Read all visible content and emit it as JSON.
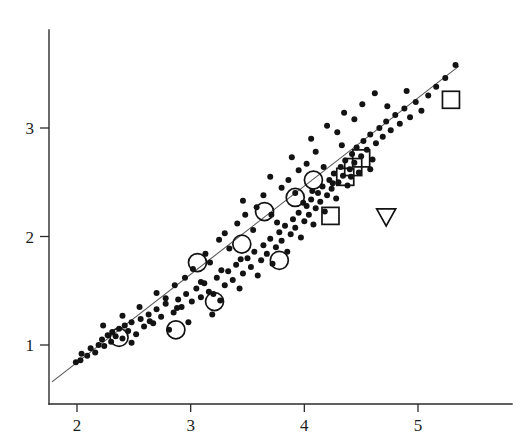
{
  "figure": {
    "width": 522,
    "height": 444,
    "background": "#ffffff",
    "ink_color": "#131313",
    "line_color": "#59595c"
  },
  "axes": {
    "x_tick_labels": [
      "2",
      "3",
      "4",
      "5"
    ],
    "y_tick_labels": [
      "1",
      "2",
      "3"
    ],
    "x_label": "",
    "y_label": "",
    "title": ""
  },
  "chart_data": {
    "type": "scatter",
    "title": "",
    "xlabel": "",
    "ylabel": "",
    "xlim": [
      1.78,
      5.58
    ],
    "ylim": [
      0.55,
      3.75
    ],
    "xticks": [
      2,
      3,
      4,
      5
    ],
    "yticks": [
      1,
      2,
      3
    ],
    "grid": false,
    "legend": "none",
    "reference_line": {
      "name": "identity-fit-line",
      "x_start": 1.78,
      "y_start": 0.66,
      "x_end": 5.36,
      "y_end": 3.57
    },
    "series": [
      {
        "name": "observations",
        "marker": "filled-circle",
        "marker_radius": 3.0,
        "points": [
          [
            1.99,
            0.84
          ],
          [
            2.03,
            0.86
          ],
          [
            2.04,
            0.92
          ],
          [
            2.09,
            0.9
          ],
          [
            2.12,
            0.97
          ],
          [
            2.16,
            0.93
          ],
          [
            2.19,
            1.0
          ],
          [
            2.22,
            1.05
          ],
          [
            2.24,
            0.99
          ],
          [
            2.27,
            1.09
          ],
          [
            2.3,
            1.03
          ],
          [
            2.31,
            1.12
          ],
          [
            2.34,
            1.08
          ],
          [
            2.37,
            1.15
          ],
          [
            2.4,
            1.06
          ],
          [
            2.42,
            1.18
          ],
          [
            2.45,
            1.13
          ],
          [
            2.48,
            1.21
          ],
          [
            2.52,
            1.1
          ],
          [
            2.56,
            1.24
          ],
          [
            2.59,
            1.17
          ],
          [
            2.63,
            1.28
          ],
          [
            2.67,
            1.2
          ],
          [
            2.7,
            1.33
          ],
          [
            2.74,
            1.26
          ],
          [
            2.78,
            1.38
          ],
          [
            2.81,
            1.14
          ],
          [
            2.85,
            1.3
          ],
          [
            2.89,
            1.42
          ],
          [
            2.92,
            1.35
          ],
          [
            2.96,
            1.47
          ],
          [
            2.98,
            1.21
          ],
          [
            3.01,
            1.4
          ],
          [
            3.05,
            1.52
          ],
          [
            3.09,
            1.44
          ],
          [
            3.12,
            1.57
          ],
          [
            3.16,
            1.49
          ],
          [
            3.19,
            1.28
          ],
          [
            3.23,
            1.62
          ],
          [
            3.26,
            1.41
          ],
          [
            3.3,
            1.55
          ],
          [
            3.33,
            1.68
          ],
          [
            3.37,
            1.6
          ],
          [
            3.4,
            1.74
          ],
          [
            3.43,
            1.52
          ],
          [
            3.46,
            1.66
          ],
          [
            3.5,
            1.8
          ],
          [
            3.53,
            1.72
          ],
          [
            3.56,
            1.86
          ],
          [
            3.59,
            1.64
          ],
          [
            3.62,
            1.78
          ],
          [
            3.64,
            1.92
          ],
          [
            3.67,
            1.84
          ],
          [
            3.7,
            1.98
          ],
          [
            3.72,
            1.75
          ],
          [
            3.75,
            1.9
          ],
          [
            3.78,
            2.04
          ],
          [
            3.8,
            1.96
          ],
          [
            3.83,
            2.1
          ],
          [
            3.85,
            1.86
          ],
          [
            3.88,
            2.02
          ],
          [
            3.9,
            2.16
          ],
          [
            3.92,
            2.08
          ],
          [
            3.95,
            2.22
          ],
          [
            3.97,
            1.99
          ],
          [
            4.0,
            2.14
          ],
          [
            4.02,
            2.28
          ],
          [
            4.04,
            2.2
          ],
          [
            4.06,
            2.34
          ],
          [
            4.08,
            2.11
          ],
          [
            4.1,
            2.26
          ],
          [
            4.12,
            2.4
          ],
          [
            4.14,
            2.32
          ],
          [
            4.16,
            2.46
          ],
          [
            4.18,
            2.23
          ],
          [
            4.2,
            2.38
          ],
          [
            4.22,
            2.52
          ],
          [
            4.24,
            2.44
          ],
          [
            4.26,
            2.58
          ],
          [
            4.28,
            2.35
          ],
          [
            4.3,
            2.5
          ],
          [
            4.32,
            2.64
          ],
          [
            4.34,
            2.56
          ],
          [
            4.36,
            2.7
          ],
          [
            4.38,
            2.47
          ],
          [
            4.4,
            2.62
          ],
          [
            4.42,
            2.76
          ],
          [
            4.44,
            2.68
          ],
          [
            4.46,
            2.82
          ],
          [
            4.48,
            2.59
          ],
          [
            4.5,
            2.74
          ],
          [
            4.52,
            2.88
          ],
          [
            4.55,
            2.8
          ],
          [
            4.58,
            2.94
          ],
          [
            4.6,
            2.71
          ],
          [
            4.63,
            2.86
          ],
          [
            4.66,
            3.0
          ],
          [
            4.69,
            2.92
          ],
          [
            4.72,
            3.06
          ],
          [
            4.76,
            2.98
          ],
          [
            4.8,
            3.12
          ],
          [
            4.84,
            3.04
          ],
          [
            4.88,
            3.18
          ],
          [
            4.93,
            3.1
          ],
          [
            4.98,
            3.24
          ],
          [
            5.03,
            3.16
          ],
          [
            5.09,
            3.3
          ],
          [
            5.16,
            3.38
          ],
          [
            5.24,
            3.46
          ],
          [
            5.33,
            3.58
          ],
          [
            3.7,
            2.55
          ],
          [
            3.46,
            2.33
          ],
          [
            3.89,
            2.73
          ],
          [
            4.06,
            2.9
          ],
          [
            3.3,
            2.03
          ],
          [
            3.13,
            1.84
          ],
          [
            4.2,
            3.02
          ],
          [
            4.35,
            3.14
          ],
          [
            3.02,
            1.7
          ],
          [
            2.86,
            1.55
          ],
          [
            4.51,
            3.22
          ],
          [
            2.7,
            1.48
          ],
          [
            3.58,
            2.27
          ],
          [
            3.41,
            2.12
          ],
          [
            3.25,
            1.97
          ],
          [
            3.95,
            2.61
          ],
          [
            4.1,
            2.78
          ],
          [
            2.55,
            1.35
          ],
          [
            2.4,
            1.27
          ],
          [
            3.8,
            2.45
          ],
          [
            4.29,
            2.96
          ],
          [
            3.64,
            2.38
          ],
          [
            3.48,
            2.2
          ],
          [
            2.23,
            1.18
          ],
          [
            2.95,
            1.62
          ],
          [
            3.34,
            1.89
          ],
          [
            4.44,
            3.08
          ],
          [
            3.17,
            1.76
          ],
          [
            3.86,
            2.52
          ],
          [
            4.02,
            2.67
          ],
          [
            2.78,
            1.43
          ],
          [
            4.62,
            3.32
          ],
          [
            3.55,
            2.06
          ],
          [
            3.71,
            2.2
          ],
          [
            4.17,
            2.64
          ],
          [
            3.09,
            1.58
          ],
          [
            2.64,
            1.22
          ],
          [
            3.27,
            1.69
          ],
          [
            4.33,
            2.84
          ],
          [
            3.92,
            2.4
          ],
          [
            4.58,
            2.62
          ],
          [
            4.25,
            2.49
          ],
          [
            2.88,
            1.34
          ],
          [
            4.73,
            3.2
          ],
          [
            3.44,
            1.79
          ],
          [
            3.76,
            2.13
          ],
          [
            4.07,
            2.42
          ],
          [
            2.48,
            1.02
          ],
          [
            4.9,
            3.34
          ],
          [
            4.41,
            2.55
          ],
          [
            3.99,
            2.31
          ],
          [
            3.2,
            1.47
          ]
        ]
      },
      {
        "name": "highlighted-open-circles",
        "marker": "open-circle",
        "marker_radius": 9.0,
        "points": [
          [
            2.37,
            1.07
          ],
          [
            2.87,
            1.14
          ],
          [
            3.06,
            1.76
          ],
          [
            3.21,
            1.4
          ],
          [
            3.45,
            1.93
          ],
          [
            3.65,
            2.23
          ],
          [
            3.78,
            1.78
          ],
          [
            3.92,
            2.36
          ],
          [
            4.08,
            2.52
          ]
        ]
      },
      {
        "name": "highlighted-open-squares",
        "marker": "open-square",
        "marker_size": 17.0,
        "points": [
          [
            5.29,
            3.26
          ],
          [
            4.5,
            2.72
          ],
          [
            4.43,
            2.64
          ],
          [
            4.36,
            2.55
          ],
          [
            4.23,
            2.19
          ]
        ]
      },
      {
        "name": "highlighted-open-triangle",
        "marker": "open-triangle-down",
        "marker_size": 19.0,
        "points": [
          [
            4.72,
            2.18
          ]
        ]
      }
    ]
  }
}
